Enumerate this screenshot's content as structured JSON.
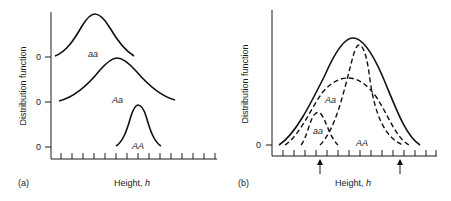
{
  "panel_a": {
    "tag": "(a)",
    "y_label": "Distribution function",
    "x_label_main": "Height, ",
    "x_label_var": "h",
    "zero_labels": [
      "0",
      "0",
      "0"
    ],
    "curves": [
      {
        "genotype": "aa",
        "label": "aa",
        "style": "solid"
      },
      {
        "genotype": "Aa",
        "label": "Aa",
        "style": "solid"
      },
      {
        "genotype": "AA",
        "label": "AA",
        "style": "solid"
      }
    ],
    "tick_count": 15
  },
  "panel_b": {
    "tag": "(b)",
    "y_label": "Distribution function",
    "x_label_main": "Height, ",
    "x_label_var": "h",
    "zero_label": "0",
    "curves": [
      {
        "genotype": "total",
        "label": "",
        "style": "solid"
      },
      {
        "genotype": "aa",
        "label": "aa",
        "style": "dashed"
      },
      {
        "genotype": "Aa",
        "label": "Aa",
        "style": "dashed"
      },
      {
        "genotype": "AA",
        "label": "AA",
        "style": "dashed"
      }
    ],
    "arrows": [
      "up-arrow",
      "up-arrow"
    ],
    "tick_count": 15
  },
  "colors": {
    "ink": "#111111",
    "background": "#ffffff"
  }
}
